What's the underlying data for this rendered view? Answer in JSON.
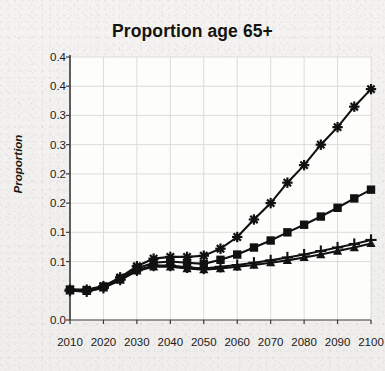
{
  "chart_data": {
    "type": "line",
    "title": "Proportion age 65+",
    "xlabel": "",
    "ylabel": "Proportion",
    "grid": true,
    "legend": "none",
    "xlim": [
      2010,
      2100
    ],
    "ylim": [
      0.0,
      0.45
    ],
    "x_tick_labels": [
      "2010",
      "2020",
      "2030",
      "2040",
      "2050",
      "2060",
      "2070",
      "2080",
      "2090",
      "2100"
    ],
    "x_tick_values": [
      2010,
      2020,
      2030,
      2040,
      2050,
      2060,
      2070,
      2080,
      2090,
      2100
    ],
    "y_tick_labels": [
      "0.4",
      "0.4",
      "0.3",
      "0.3",
      "0.2",
      "0.2",
      "0.1",
      "0.1",
      "0.0"
    ],
    "y_tick_values": [
      0.45,
      0.4,
      0.35,
      0.3,
      0.25,
      0.2,
      0.15,
      0.1,
      0.0
    ],
    "x": [
      2010,
      2015,
      2020,
      2025,
      2030,
      2035,
      2040,
      2045,
      2050,
      2055,
      2060,
      2065,
      2070,
      2075,
      2080,
      2085,
      2090,
      2095,
      2100
    ],
    "series": [
      {
        "name": "series-star",
        "marker": "star",
        "color": "#111111",
        "values": [
          0.052,
          0.052,
          0.058,
          0.073,
          0.092,
          0.105,
          0.108,
          0.108,
          0.11,
          0.122,
          0.142,
          0.172,
          0.2,
          0.235,
          0.265,
          0.3,
          0.33,
          0.365,
          0.395
        ]
      },
      {
        "name": "series-square",
        "marker": "square",
        "color": "#111111",
        "values": [
          0.052,
          0.051,
          0.057,
          0.071,
          0.088,
          0.098,
          0.1,
          0.098,
          0.096,
          0.103,
          0.112,
          0.124,
          0.136,
          0.15,
          0.163,
          0.177,
          0.192,
          0.208,
          0.223
        ]
      },
      {
        "name": "series-plus",
        "marker": "plus",
        "color": "#111111",
        "values": [
          0.05,
          0.049,
          0.055,
          0.069,
          0.085,
          0.093,
          0.093,
          0.09,
          0.088,
          0.091,
          0.094,
          0.098,
          0.102,
          0.107,
          0.112,
          0.118,
          0.124,
          0.13,
          0.137
        ]
      },
      {
        "name": "series-triangle",
        "marker": "triangle",
        "color": "#111111",
        "values": [
          0.05,
          0.049,
          0.055,
          0.068,
          0.084,
          0.091,
          0.091,
          0.088,
          0.086,
          0.088,
          0.091,
          0.094,
          0.098,
          0.102,
          0.107,
          0.112,
          0.118,
          0.124,
          0.131
        ]
      }
    ]
  },
  "colors": {
    "ink": "#111111",
    "axis": "#3a3a3a",
    "grid": "#d8d8d6",
    "paper": "#f2f1ef",
    "plot_bg": "#fdfdfc"
  }
}
